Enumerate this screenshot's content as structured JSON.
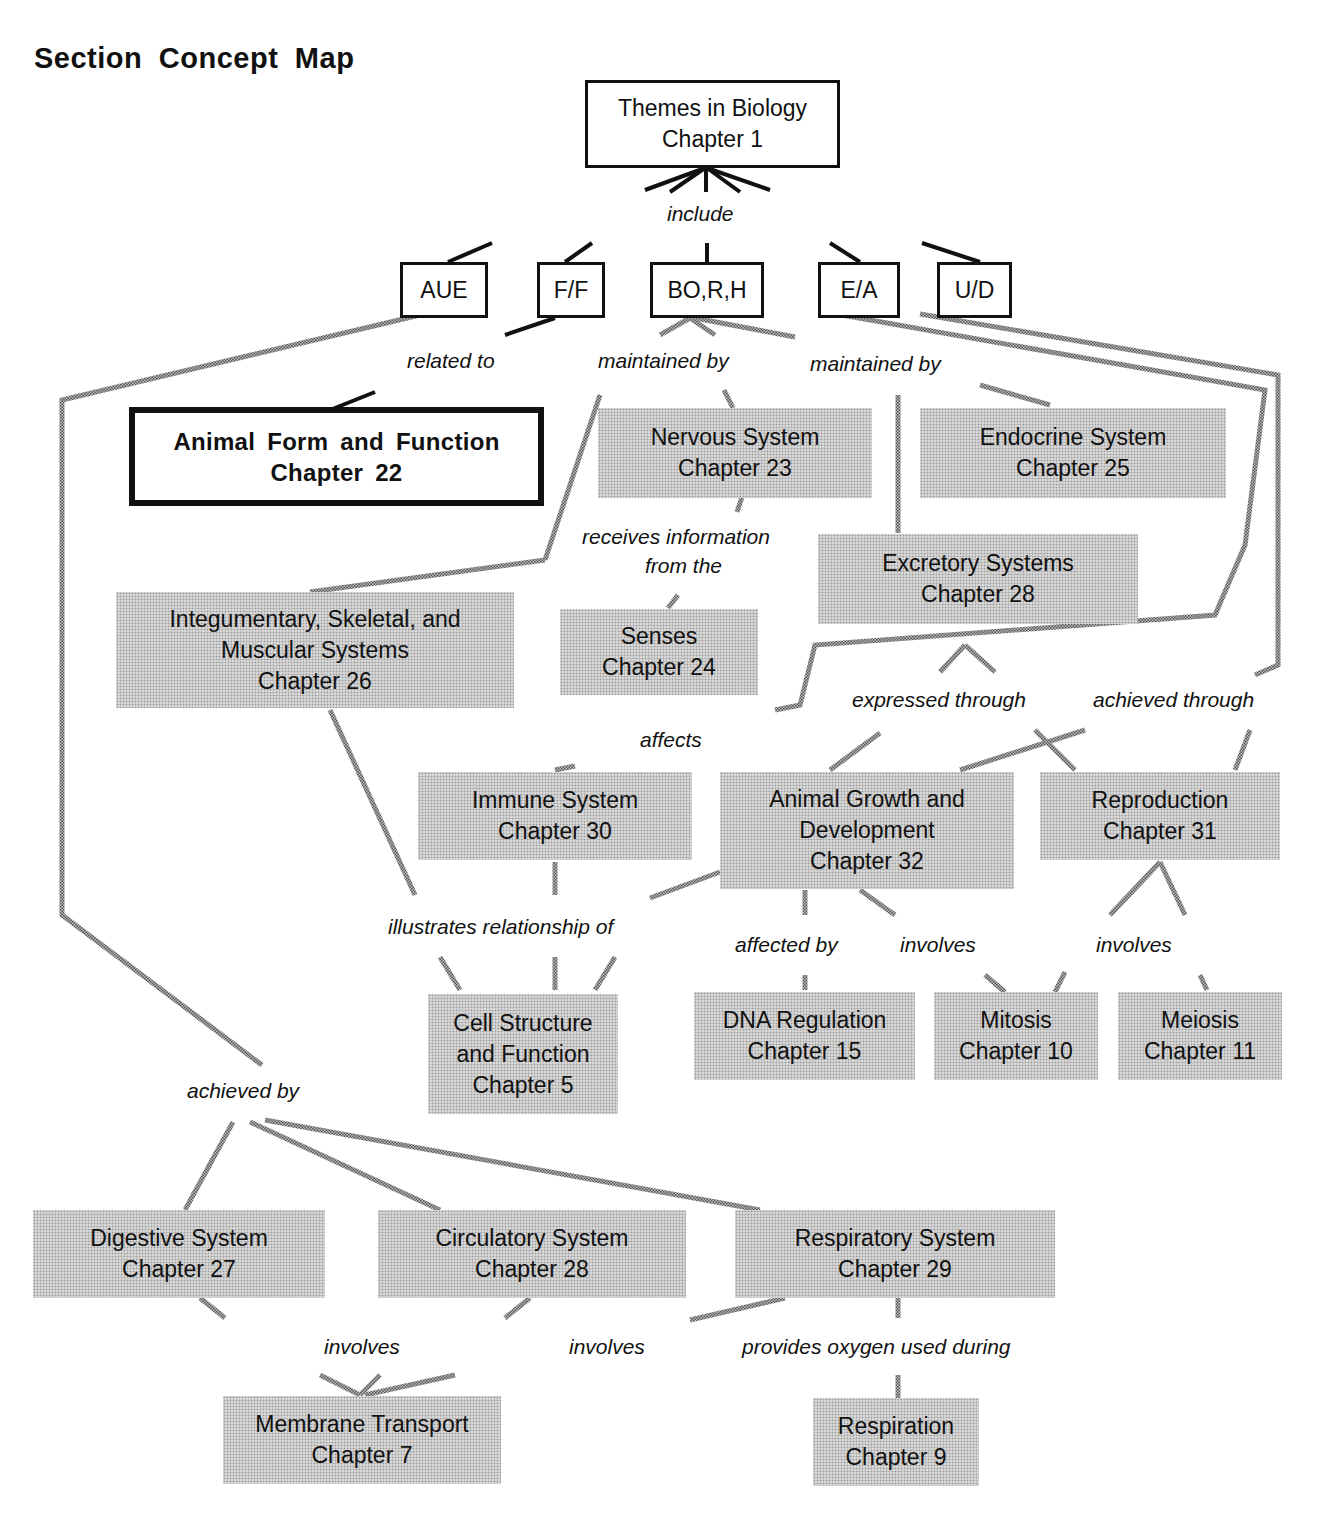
{
  "title": "Section Concept Map",
  "nodes": {
    "themes": {
      "line1": "Themes in Biology",
      "line2": "Chapter 1"
    },
    "aue": {
      "line1": "AUE"
    },
    "ff": {
      "line1": "F/F"
    },
    "borh": {
      "line1": "BO,R,H"
    },
    "ea": {
      "line1": "E/A"
    },
    "ud": {
      "line1": "U/D"
    },
    "animal_form": {
      "line1": "Animal Form and Function",
      "line2": "Chapter 22"
    },
    "nervous": {
      "line1": "Nervous System",
      "line2": "Chapter 23"
    },
    "endocrine": {
      "line1": "Endocrine System",
      "line2": "Chapter 25"
    },
    "excretory": {
      "line1": "Excretory Systems",
      "line2": "Chapter 28"
    },
    "integumentary": {
      "line1": "Integumentary, Skeletal, and",
      "line2": "Muscular Systems",
      "line3": "Chapter 26"
    },
    "senses": {
      "line1": "Senses",
      "line2": "Chapter 24"
    },
    "immune": {
      "line1": "Immune System",
      "line2": "Chapter 30"
    },
    "growth": {
      "line1": "Animal Growth and",
      "line2": "Development",
      "line3": "Chapter 32"
    },
    "reproduction": {
      "line1": "Reproduction",
      "line2": "Chapter 31"
    },
    "cell": {
      "line1": "Cell Structure",
      "line2": "and Function",
      "line3": "Chapter 5"
    },
    "dna": {
      "line1": "DNA Regulation",
      "line2": "Chapter 15"
    },
    "mitosis": {
      "line1": "Mitosis",
      "line2": "Chapter 10"
    },
    "meiosis": {
      "line1": "Meiosis",
      "line2": "Chapter 11"
    },
    "digestive": {
      "line1": "Digestive System",
      "line2": "Chapter 27"
    },
    "circulatory": {
      "line1": "Circulatory System",
      "line2": "Chapter 28"
    },
    "respiratory": {
      "line1": "Respiratory System",
      "line2": "Chapter 29"
    },
    "membrane": {
      "line1": "Membrane Transport",
      "line2": "Chapter 7"
    },
    "respiration": {
      "line1": "Respiration",
      "line2": "Chapter 9"
    }
  },
  "links": {
    "include": "include",
    "related_to": "related to",
    "maintained_by_1": "maintained by",
    "maintained_by_2": "maintained by",
    "receives_1": "receives information",
    "receives_2": "from  the",
    "expressed_through": "expressed through",
    "achieved_through": "achieved through",
    "affects": "affects",
    "illustrates": "illustrates relationship of",
    "affected_by": "affected by",
    "involves_1": "involves",
    "involves_2": "involves",
    "achieved_by": "achieved by",
    "involves_3": "involves",
    "involves_4": "involves",
    "provides_oxygen": "provides oxygen  used during"
  },
  "colors": {
    "ink": "#111111",
    "shade": "#d6d6d6",
    "dither": "#9a9a9a"
  }
}
